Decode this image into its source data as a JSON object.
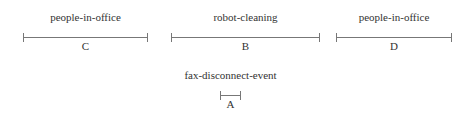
{
  "intervals": [
    {
      "id": "C",
      "event": "people-in-office",
      "x1": 23,
      "x2": 148,
      "y": 37
    },
    {
      "id": "B",
      "event": "robot-cleaning",
      "x1": 171,
      "x2": 320,
      "y": 37
    },
    {
      "id": "D",
      "event": "people-in-office",
      "x1": 336,
      "x2": 452,
      "y": 37
    },
    {
      "id": "A",
      "event": "fax-disconnect-event",
      "x1": 220,
      "x2": 241,
      "y": 95
    }
  ],
  "colors": {
    "line": "#777777",
    "text": "#333333"
  }
}
